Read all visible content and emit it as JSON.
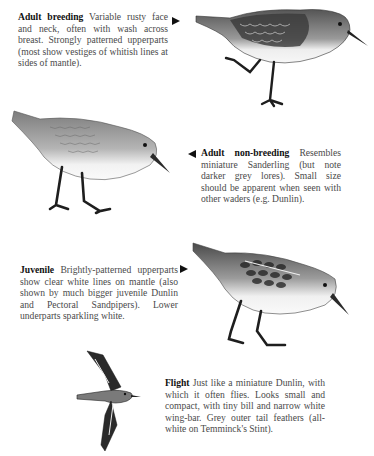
{
  "plates": [
    {
      "title": "Adult breeding",
      "text": "Variable rusty face and neck, often with wash across breast. Strongly patterned upperparts (most show vestiges of whitish lines at sides of mantle).",
      "pointer": "right"
    },
    {
      "title": "Adult non-breeding",
      "text": "Resembles miniature Sanderling (but note darker grey lores). Small size should be apparent when seen with other waders (e.g. Dunlin).",
      "pointer": "left"
    },
    {
      "title": "Juvenile",
      "text": "Brightly-patterned upperparts show clear white lines on mantle (also shown by much bigger juvenile Dunlin and Pectoral Sandpipers). Lower underparts sparkling white.",
      "pointer": "right"
    },
    {
      "title": "Flight",
      "text": "Just like a miniature Dunlin, with which it often flies. Looks small and compact, with tiny bill and narrow white wing-bar. Grey outer tail feathers (all-white on Temminck's Stint).",
      "pointer": "none"
    }
  ],
  "illustrations": [
    {
      "icon": "sandpiper-standing-one-leg-raised",
      "subject": "Adult breeding"
    },
    {
      "icon": "sandpiper-standing-feeding",
      "subject": "Adult non-breeding"
    },
    {
      "icon": "sandpiper-standing-feeding",
      "subject": "Juvenile"
    },
    {
      "icon": "sandpiper-flying",
      "subject": "Flight"
    }
  ],
  "colors": {
    "text": "#4a4a4a",
    "title": "#111111",
    "bird_dark": "#2b2b2b",
    "bird_mid": "#8a8a8a",
    "bird_light": "#e6e6e6"
  }
}
